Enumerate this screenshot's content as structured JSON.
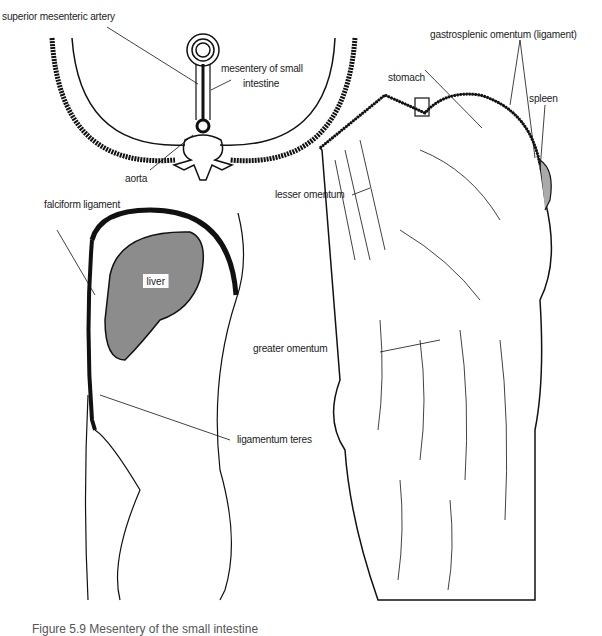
{
  "figure": {
    "caption": "Figure 5.9  Mesentery of the small intestine",
    "panels": {
      "cross_section": {
        "labels": {
          "sma": "superior mesenteric artery",
          "mesentery_1": "mesentery of small",
          "mesentery_2": "intestine",
          "aorta": "aorta"
        }
      },
      "sagittal": {
        "labels": {
          "falciform": "falciform ligament",
          "liver": "liver",
          "teres": "ligamentum teres"
        },
        "colors": {
          "liver_fill": "#8c8c8c"
        }
      },
      "omentum": {
        "labels": {
          "gastrosplenic": "gastrosplenic omentum (ligament)",
          "stomach": "stomach",
          "spleen": "spleen",
          "lesser": "lesser omentum",
          "greater": "greater omentum"
        }
      }
    }
  }
}
